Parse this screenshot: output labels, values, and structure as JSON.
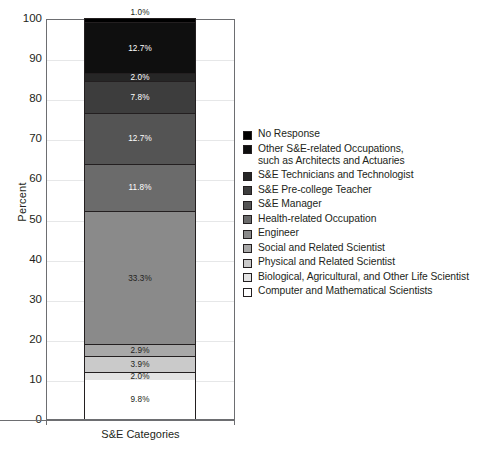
{
  "chart_data": {
    "type": "bar",
    "subtype": "stacked-bar-single-category",
    "title": "",
    "xlabel": "S&E Categories",
    "ylabel": "Percent",
    "categories": [
      "S&E Categories"
    ],
    "ylim": [
      0,
      100
    ],
    "ytick_labels": [
      "0",
      "10",
      "20",
      "30",
      "40",
      "50",
      "60",
      "70",
      "80",
      "90",
      "100"
    ],
    "ytick_values": [
      0,
      10,
      20,
      30,
      40,
      50,
      60,
      70,
      80,
      90,
      100
    ],
    "grid": true,
    "grid_axis": "y",
    "legend_position": "right",
    "stack_order": "bottom-to-top",
    "series": [
      {
        "name": "Computer and Mathematical Scientists",
        "value": 9.8,
        "label": "9.8%",
        "color": "#ffffff",
        "label_color": "#231f20",
        "label_inside": true
      },
      {
        "name": "Biological, Agricultural, and Other Life Scientist",
        "value": 2.0,
        "label": "2.0%",
        "color": "#e3e3e3",
        "label_color": "#231f20",
        "label_inside": true
      },
      {
        "name": "Physical and Related Scientist",
        "value": 3.9,
        "label": "3.9%",
        "color": "#cacaca",
        "label_color": "#231f20",
        "label_inside": true
      },
      {
        "name": "Social and Related Scientist",
        "value": 2.9,
        "label": "2.9%",
        "color": "#a8a8a8",
        "label_color": "#231f20",
        "label_inside": true
      },
      {
        "name": "Engineer",
        "value": 33.3,
        "label": "33.3%",
        "color": "#8a8a8a",
        "label_color": "#231f20",
        "label_inside": true
      },
      {
        "name": "Health-related Occupation",
        "value": 11.8,
        "label": "11.8%",
        "color": "#6b6b6b",
        "label_color": "#ffffff",
        "label_inside": true
      },
      {
        "name": "S&E Manager",
        "value": 12.7,
        "label": "12.7%",
        "color": "#545454",
        "label_color": "#ffffff",
        "label_inside": true
      },
      {
        "name": "S&E Pre-college Teacher",
        "value": 7.8,
        "label": "7.8%",
        "color": "#3d3d3d",
        "label_color": "#ffffff",
        "label_inside": true
      },
      {
        "name": "S&E Technicians and Technologist",
        "value": 2.0,
        "label": "2.0%",
        "color": "#262626",
        "label_color": "#ffffff",
        "label_inside": true
      },
      {
        "name": "Other S&E-related Occupations, such as Architects and Actuaries",
        "value": 12.7,
        "label": "12.7%",
        "color": "#0f0f0f",
        "label_color": "#ffffff",
        "label_inside": true
      },
      {
        "name": "No Response",
        "value": 1.0,
        "label": "1.0%",
        "color": "#000000",
        "label_color": "#231f20",
        "label_inside": false
      }
    ]
  },
  "axes": {
    "y_title": "Percent",
    "x_title": "S&E Categories",
    "y_ticks": [
      "100",
      "90",
      "80",
      "70",
      "60",
      "50",
      "40",
      "30",
      "20",
      "10",
      "0"
    ]
  },
  "legend": {
    "items": [
      {
        "label": "No Response",
        "color": "#000000"
      },
      {
        "label": "Other S&E-related Occupations,\nsuch as Architects and Actuaries",
        "color": "#0f0f0f"
      },
      {
        "label": "S&E Technicians and Technologist",
        "color": "#262626"
      },
      {
        "label": "S&E Pre-college Teacher",
        "color": "#3d3d3d"
      },
      {
        "label": "S&E Manager",
        "color": "#545454"
      },
      {
        "label": "Health-related Occupation",
        "color": "#6b6b6b"
      },
      {
        "label": "Engineer",
        "color": "#8a8a8a"
      },
      {
        "label": "Social and Related Scientist",
        "color": "#a8a8a8"
      },
      {
        "label": "Physical and Related Scientist",
        "color": "#cacaca"
      },
      {
        "label": "Biological, Agricultural, and Other Life Scientist",
        "color": "#e3e3e3"
      },
      {
        "label": "Computer and Mathematical Scientists",
        "color": "#ffffff"
      }
    ]
  },
  "colors": {
    "axis": "#6d6e71",
    "grid": "#e6e7e8",
    "text": "#231f20",
    "bar_outline": "#231f20"
  }
}
